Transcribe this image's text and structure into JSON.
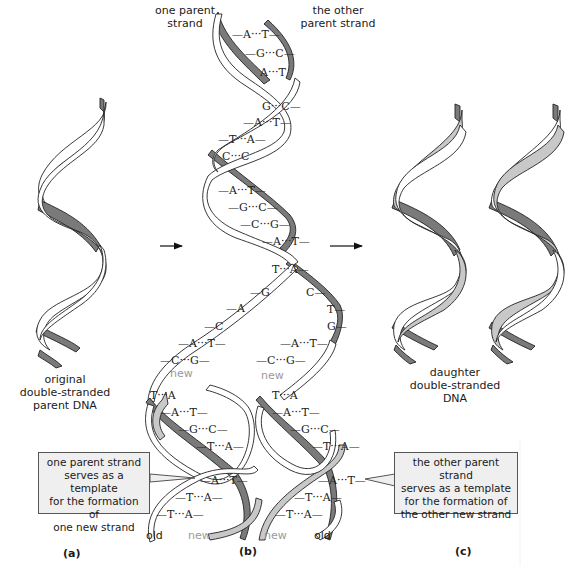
{
  "colors": {
    "old_strand": "#7a7a7a",
    "new_strand": "#c8c8c8",
    "outline": "#222222",
    "callout_bg": "#efefef",
    "new_label": "#9a9a9a"
  },
  "panel_a": {
    "label": "(a)",
    "caption_lines": [
      "original",
      "double-stranded",
      "parent DNA"
    ]
  },
  "panel_b": {
    "label": "(b)",
    "top_left_label_lines": [
      "one parent",
      "strand"
    ],
    "top_right_label_lines": [
      "the other",
      "parent strand"
    ],
    "parent_base_pairs": [
      {
        "left": "A",
        "right": "T"
      },
      {
        "left": "G",
        "right": "C"
      },
      {
        "left": "A",
        "right": "T"
      },
      {
        "left": "G",
        "right": "C"
      },
      {
        "left": "A",
        "right": "T"
      },
      {
        "left": "T",
        "right": "A"
      },
      {
        "left": "C",
        "right": "C"
      },
      {
        "left": "A",
        "right": "T"
      },
      {
        "left": "G",
        "right": "C"
      },
      {
        "left": "C",
        "right": "G"
      },
      {
        "left": "A",
        "right": "T"
      },
      {
        "left": "T",
        "right": "A"
      }
    ],
    "left_unpaired_bases": [
      "G",
      "A",
      "C"
    ],
    "right_unpaired_bases": [
      "C",
      "T",
      "G"
    ],
    "left_daughter_pairs": [
      {
        "left": "A",
        "right": "T"
      },
      {
        "left": "C",
        "right": "G"
      },
      {
        "left": "T",
        "right": "A"
      },
      {
        "left": "A",
        "right": "T"
      },
      {
        "left": "G",
        "right": "C"
      },
      {
        "left": "T",
        "right": "A"
      },
      {
        "left": "A",
        "right": "T"
      },
      {
        "left": "T",
        "right": "A"
      },
      {
        "left": "T",
        "right": "A"
      }
    ],
    "right_daughter_pairs": [
      {
        "left": "A",
        "right": "T"
      },
      {
        "left": "C",
        "right": "G"
      },
      {
        "left": "T",
        "right": "A"
      },
      {
        "left": "A",
        "right": "T"
      },
      {
        "left": "G",
        "right": "C"
      },
      {
        "left": "T",
        "right": "A"
      },
      {
        "left": "A",
        "right": "T"
      },
      {
        "left": "T",
        "right": "A"
      },
      {
        "left": "T",
        "right": "A"
      }
    ],
    "new_label_left": "new",
    "new_label_right": "new",
    "bottom_labels": {
      "left_old": "old",
      "left_new": "new",
      "right_new": "new",
      "right_old": "old"
    },
    "callout_left_lines": [
      "one parent strand",
      "serves as a template",
      "for the formation of",
      "one new strand"
    ],
    "callout_right_lines": [
      "the other parent strand",
      "serves as a template",
      "for the formation of",
      "the other new strand"
    ]
  },
  "panel_c": {
    "label": "(c)",
    "caption_lines": [
      "daughter",
      "double-stranded",
      "DNA"
    ]
  },
  "arrows": [
    {
      "name": "arrow-a-to-b"
    },
    {
      "name": "arrow-b-to-c"
    }
  ]
}
